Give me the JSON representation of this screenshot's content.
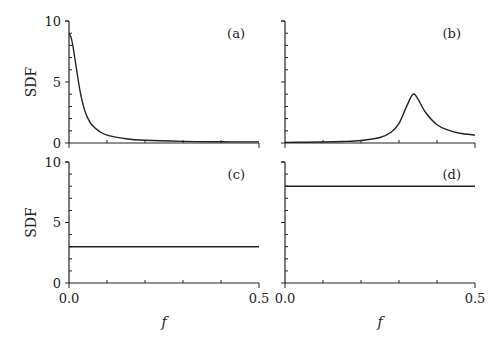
{
  "chart_data": [
    {
      "panel": "(a)",
      "type": "line",
      "ylabel": "SDF",
      "xlabel": "",
      "xlim": [
        0,
        0.5
      ],
      "ylim": [
        0,
        10
      ],
      "yticks_labeled": [
        "0",
        "5",
        "10"
      ],
      "xticks_labeled": [],
      "series": [
        {
          "name": "SDF",
          "x": [
            0,
            0.005,
            0.01,
            0.02,
            0.03,
            0.04,
            0.05,
            0.06,
            0.08,
            0.1,
            0.15,
            0.2,
            0.3,
            0.4,
            0.5
          ],
          "values": [
            9.0,
            8.7,
            8.0,
            6.0,
            4.1,
            2.8,
            2.0,
            1.5,
            0.95,
            0.65,
            0.35,
            0.22,
            0.13,
            0.1,
            0.09
          ]
        }
      ]
    },
    {
      "panel": "(b)",
      "type": "line",
      "ylabel": "",
      "xlabel": "",
      "xlim": [
        0,
        0.5
      ],
      "ylim": [
        0,
        10
      ],
      "yticks_labeled": [],
      "xticks_labeled": [],
      "series": [
        {
          "name": "SDF",
          "x": [
            0,
            0.05,
            0.1,
            0.15,
            0.2,
            0.25,
            0.28,
            0.3,
            0.32,
            0.337,
            0.35,
            0.37,
            0.4,
            0.43,
            0.46,
            0.5
          ],
          "values": [
            0.05,
            0.06,
            0.08,
            0.12,
            0.2,
            0.45,
            0.9,
            1.6,
            3.0,
            4.0,
            3.6,
            2.5,
            1.5,
            1.05,
            0.8,
            0.65
          ]
        }
      ]
    },
    {
      "panel": "(c)",
      "type": "line",
      "ylabel": "SDF",
      "xlabel": "f",
      "xlim": [
        0,
        0.5
      ],
      "ylim": [
        0,
        10
      ],
      "yticks_labeled": [
        "0",
        "5",
        "10"
      ],
      "xticks_labeled": [
        "0.0",
        "0.5"
      ],
      "series": [
        {
          "name": "SDF",
          "x": [
            0,
            0.5
          ],
          "values": [
            3,
            3
          ]
        }
      ]
    },
    {
      "panel": "(d)",
      "type": "line",
      "ylabel": "",
      "xlabel": "f",
      "xlim": [
        0,
        0.5
      ],
      "ylim": [
        0,
        10
      ],
      "yticks_labeled": [],
      "xticks_labeled": [
        "0.0",
        "0.5"
      ],
      "series": [
        {
          "name": "SDF",
          "x": [
            0,
            0.5
          ],
          "values": [
            8,
            8
          ]
        }
      ]
    }
  ],
  "labels": {
    "ylabel": "SDF",
    "xlabel": "f",
    "panels": [
      "(a)",
      "(b)",
      "(c)",
      "(d)"
    ],
    "y0": "0",
    "y5": "5",
    "y10": "10",
    "x0": "0.0",
    "x5": "0.5"
  }
}
